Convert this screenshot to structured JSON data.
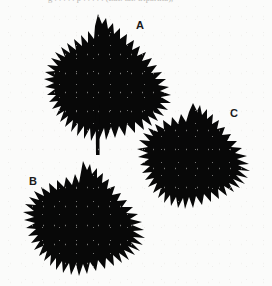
{
  "figure": {
    "background_color": "#fbfbfa",
    "ink_color": "#080808",
    "caption_fragment": "g      . . . . .  p . . . . .  (Lat. lat. tripartita),",
    "specimens": [
      {
        "id": "A",
        "label": "A",
        "label_x": 136,
        "label_y": 20,
        "description": "deeply dissected palmate leaf with narrow finely-toothed lobes and long petiole",
        "lobes": 7,
        "has_petiole": true
      },
      {
        "id": "B",
        "label": "B",
        "label_x": 29,
        "label_y": 176,
        "description": "palmate leaf with broad shallowly-cut lobes and coarse marginal teeth",
        "lobes": 5,
        "has_petiole": false
      },
      {
        "id": "C",
        "label": "C",
        "label_x": 230,
        "label_y": 108,
        "description": "palmate leaf with intermediate lobe width and serrate margins",
        "lobes": 5,
        "has_petiole": false
      }
    ]
  }
}
